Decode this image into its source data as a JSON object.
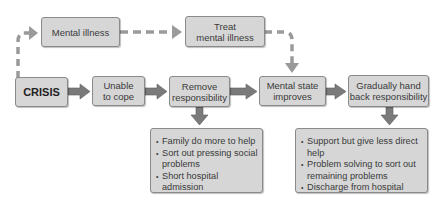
{
  "diagram": {
    "type": "flowchart",
    "nodes": {
      "mental_illness": "Mental illness",
      "treat_line1": "Treat",
      "treat_line2": "mental illness",
      "crisis": "CRISIS",
      "unable_line1": "Unable",
      "unable_line2": "to cope",
      "remove_line1": "Remove",
      "remove_line2": "responsibility",
      "improves_line1": "Mental state",
      "improves_line2": "improves",
      "handback_line1": "Gradually hand",
      "handback_line2": "back responsibility"
    },
    "remove_actions": [
      "Family do more to help",
      "Sort out pressing social problems",
      "Short hospital admission"
    ],
    "remove_actions_lines": {
      "l1": "Family do more to help",
      "l2a": "Sort out pressing social",
      "l2b": "problems",
      "l3": "Short hospital admission"
    },
    "handback_actions": [
      "Support but give less direct help",
      "Problem solving to sort out remaining problems",
      "Discharge from hospital"
    ],
    "handback_actions_lines": {
      "l1": "Support but give less direct help",
      "l2a": "Problem solving to sort out",
      "l2b": "remaining problems",
      "l3": "Discharge from hospital"
    },
    "edges": [
      {
        "from": "CRISIS",
        "to": "Mental illness",
        "style": "dashed"
      },
      {
        "from": "Mental illness",
        "to": "Treat mental illness",
        "style": "dashed"
      },
      {
        "from": "Treat mental illness",
        "to": "Mental state improves",
        "style": "dashed"
      },
      {
        "from": "CRISIS",
        "to": "Unable to cope",
        "style": "solid"
      },
      {
        "from": "Unable to cope",
        "to": "Remove responsibility",
        "style": "solid"
      },
      {
        "from": "Remove responsibility",
        "to": "Mental state improves",
        "style": "solid"
      },
      {
        "from": "Mental state improves",
        "to": "Gradually hand back responsibility",
        "style": "solid"
      },
      {
        "from": "Remove responsibility",
        "to": "remove_actions",
        "style": "solid"
      },
      {
        "from": "Gradually hand back responsibility",
        "to": "handback_actions",
        "style": "solid"
      }
    ],
    "colors": {
      "box_fill": "#d6d6d6",
      "box_border": "#8a8a8a",
      "arrow": "#7a7a7a",
      "dashed": "#9a9a9a"
    }
  }
}
